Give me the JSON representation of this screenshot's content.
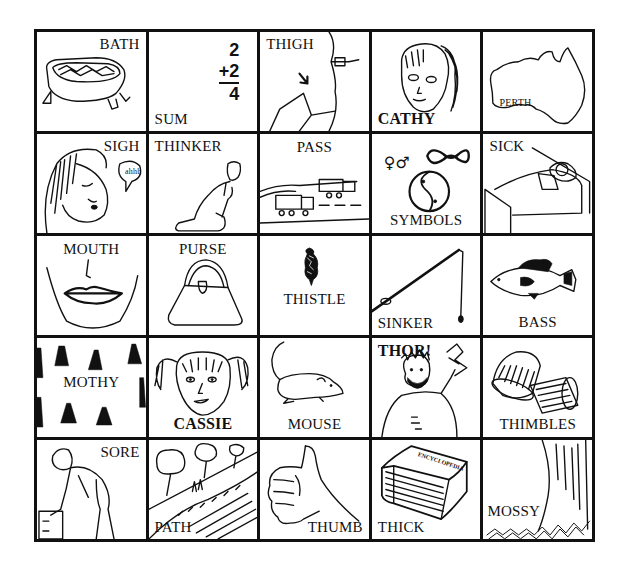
{
  "worksheet": {
    "grid": {
      "rows": 5,
      "columns": 5,
      "cells": [
        {
          "row": 1,
          "col": 1,
          "label": "BATH",
          "icon": "bathtub-icon"
        },
        {
          "row": 1,
          "col": 2,
          "label": "SUM",
          "icon": "addition-sum-icon",
          "math": {
            "top": "2",
            "addend": "+2",
            "result": "4"
          }
        },
        {
          "row": 1,
          "col": 3,
          "label": "THIGH",
          "icon": "thigh-arrow-icon"
        },
        {
          "row": 1,
          "col": 4,
          "label": "CATHY",
          "icon": "girl-ponytail-face-icon"
        },
        {
          "row": 1,
          "col": 5,
          "label": "",
          "icon": "australia-map-icon",
          "map_label": "PERTH"
        },
        {
          "row": 2,
          "col": 1,
          "label": "SIGH",
          "icon": "sighing-woman-icon",
          "bubble_text": "ahhh"
        },
        {
          "row": 2,
          "col": 2,
          "label": "THINKER",
          "icon": "thinker-statue-icon"
        },
        {
          "row": 2,
          "col": 3,
          "label": "PASS",
          "icon": "trucks-passing-icon"
        },
        {
          "row": 2,
          "col": 4,
          "label": "SYMBOLS",
          "icon": "symbols-icon",
          "symbols": [
            "♀",
            "♂",
            "∞",
            "☯"
          ]
        },
        {
          "row": 2,
          "col": 5,
          "label": "SICK",
          "icon": "sick-in-bed-icon"
        },
        {
          "row": 3,
          "col": 1,
          "label": "MOUTH",
          "icon": "mouth-icon"
        },
        {
          "row": 3,
          "col": 2,
          "label": "PURSE",
          "icon": "handbag-icon"
        },
        {
          "row": 3,
          "col": 3,
          "label": "THISTLE",
          "icon": "thistle-icon"
        },
        {
          "row": 3,
          "col": 4,
          "label": "SINKER",
          "icon": "fishing-rod-sinker-icon"
        },
        {
          "row": 3,
          "col": 5,
          "label": "BASS",
          "icon": "bass-fish-icon"
        },
        {
          "row": 4,
          "col": 1,
          "label": "MOTHY",
          "icon": "moths-icon"
        },
        {
          "row": 4,
          "col": 2,
          "label": "CASSIE",
          "icon": "girl-pigtails-face-icon"
        },
        {
          "row": 4,
          "col": 3,
          "label": "MOUSE",
          "icon": "mouse-icon"
        },
        {
          "row": 4,
          "col": 4,
          "label": "THOR!",
          "icon": "thor-lightning-icon"
        },
        {
          "row": 4,
          "col": 5,
          "label": "THIMBLES",
          "icon": "thimbles-icon"
        },
        {
          "row": 5,
          "col": 1,
          "label": "SORE",
          "icon": "sore-back-man-icon"
        },
        {
          "row": 5,
          "col": 2,
          "label": "PATH",
          "icon": "hill-path-icon"
        },
        {
          "row": 5,
          "col": 3,
          "label": "THUMB",
          "icon": "thumbs-up-icon"
        },
        {
          "row": 5,
          "col": 4,
          "label": "THICK",
          "icon": "thick-book-icon",
          "book_title": "ENCYCLOPEDIA"
        },
        {
          "row": 5,
          "col": 5,
          "label": "MOSSY",
          "icon": "mossy-tree-icon"
        }
      ]
    }
  }
}
